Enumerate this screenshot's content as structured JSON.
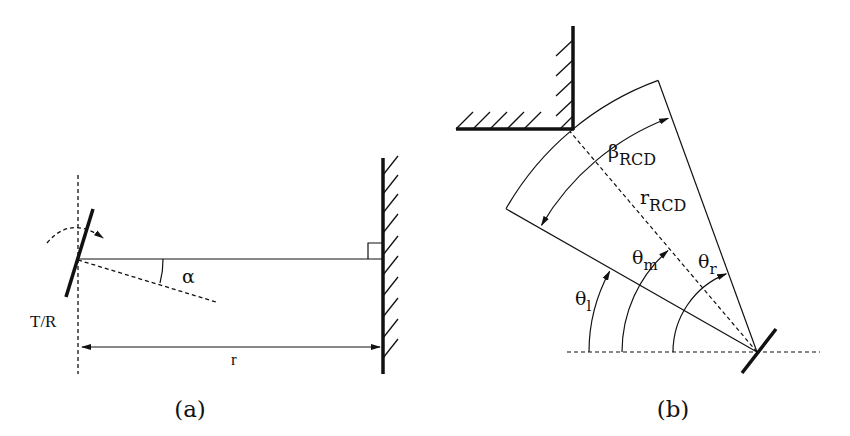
{
  "figure": {
    "panels": [
      {
        "id": "a",
        "caption": "(a)",
        "labels": {
          "transceiver": "T/R",
          "angle": "α",
          "distance": "r"
        }
      },
      {
        "id": "b",
        "caption": "(b)",
        "labels": {
          "beta": "β",
          "beta_sub": "RCD",
          "radius": "r",
          "radius_sub": "RCD",
          "theta_l": "θ",
          "theta_l_sub": "l",
          "theta_m": "θ",
          "theta_m_sub": "m",
          "theta_r": "θ",
          "theta_r_sub": "r"
        }
      }
    ],
    "colors": {
      "ink": "#111111",
      "background": "#ffffff"
    }
  }
}
